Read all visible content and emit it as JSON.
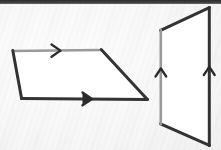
{
  "figure": {
    "canvas": {
      "width": 221,
      "height": 150
    },
    "background_color": "#fbfbfb",
    "top_band_color": "#333333",
    "stroke_dark": "#333333",
    "stroke_light": "#9a9a9a",
    "fill_color": "#ffffff",
    "shapes": [
      {
        "name": "left-parallelogram",
        "orientation": "horizontal",
        "points": "13,51 101,50 147,99 22,98",
        "edges": [
          {
            "name": "top-edge",
            "from": "13,51",
            "to": "101,50",
            "color": "#9a9a9a",
            "width": 2.6,
            "arrow": "right"
          },
          {
            "name": "right-edge",
            "from": "101,50",
            "to": "147,99",
            "color": "#333333",
            "width": 3.0,
            "arrow": "none"
          },
          {
            "name": "bottom-edge",
            "from": "22,98",
            "to": "147,99",
            "color": "#333333",
            "width": 3.0,
            "arrow": "right"
          },
          {
            "name": "left-edge",
            "from": "13,51",
            "to": "22,98",
            "color": "#333333",
            "width": 3.0,
            "arrow": "none"
          }
        ],
        "arrow_marks": [
          {
            "name": "top-edge-arrow",
            "direction": "right",
            "x": 57,
            "y": 50.6,
            "color": "#2b2b2b"
          },
          {
            "name": "bottom-edge-arrow",
            "direction": "right",
            "x": 89,
            "y": 98.7,
            "color": "#2b2b2b"
          }
        ]
      },
      {
        "name": "right-parallelogram",
        "orientation": "vertical",
        "points": "161,30 209,8 209,145 161,124",
        "edges": [
          {
            "name": "top-edge",
            "from": "161,30",
            "to": "209,8",
            "color": "#333333",
            "width": 3.0,
            "arrow": "none"
          },
          {
            "name": "right-edge",
            "from": "209,8",
            "to": "209,145",
            "color": "#333333",
            "width": 3.0,
            "arrow": "up"
          },
          {
            "name": "bottom-edge",
            "from": "161,124",
            "to": "209,145",
            "color": "#333333",
            "width": 3.0,
            "arrow": "none"
          },
          {
            "name": "left-edge",
            "from": "161,30",
            "to": "161,124",
            "color": "#9a9a9a",
            "width": 2.6,
            "arrow": "up"
          }
        ],
        "arrow_marks": [
          {
            "name": "left-edge-arrow",
            "direction": "up",
            "x": 161,
            "y": 70,
            "color": "#2b2b2b"
          },
          {
            "name": "right-edge-arrow",
            "direction": "up",
            "x": 209,
            "y": 68,
            "color": "#2b2b2b"
          }
        ]
      }
    ]
  }
}
